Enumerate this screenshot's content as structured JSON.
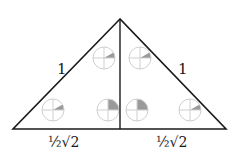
{
  "diagram": {
    "type": "geometry",
    "colors": {
      "stroke": "#1a1a1a",
      "circle_stroke": "#cfcfcf",
      "sector_fill": "#9a9a9a",
      "background": "#ffffff"
    },
    "labels": {
      "left_hypotenuse": "1",
      "right_hypotenuse": "1",
      "left_base": "½√2",
      "right_base": "½√2"
    },
    "vertices": {
      "apex": [
        120,
        19
      ],
      "bottom_left": [
        13,
        129
      ],
      "bottom_right": [
        226,
        129
      ],
      "foot": [
        120,
        129
      ]
    },
    "angle_markers": [
      {
        "id": "top-left",
        "cx": 104,
        "cy": 58,
        "r": 11,
        "sector_deg": 30
      },
      {
        "id": "top-right",
        "cx": 140,
        "cy": 58,
        "r": 11,
        "sector_deg": 30
      },
      {
        "id": "bottom-left",
        "cx": 53,
        "cy": 110,
        "r": 11,
        "sector_deg": 30
      },
      {
        "id": "bottom-inner-left",
        "cx": 108,
        "cy": 110,
        "r": 11,
        "sector_deg": 90
      },
      {
        "id": "bottom-inner-right",
        "cx": 137,
        "cy": 110,
        "r": 11,
        "sector_deg": 90
      },
      {
        "id": "bottom-right",
        "cx": 190,
        "cy": 110,
        "r": 11,
        "sector_deg": 30
      }
    ]
  }
}
